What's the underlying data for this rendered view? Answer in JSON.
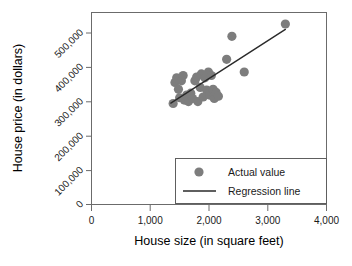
{
  "chart_data": {
    "type": "scatter",
    "title": "",
    "xlabel": "House size (in square feet)",
    "ylabel": "House price (in dollars)",
    "xlim": [
      0,
      4000
    ],
    "ylim": [
      0,
      500000
    ],
    "grid": false,
    "legend_position": "inside-bottom-right",
    "xticks": [
      0,
      1000,
      2000,
      3000,
      4000
    ],
    "xticklabels": [
      "0",
      "1,000",
      "2,000",
      "3,000",
      "4,000"
    ],
    "yticks": [
      0,
      100000,
      200000,
      300000,
      400000,
      500000
    ],
    "yticklabels": [
      "0",
      "100,000",
      "200,000",
      "300,000",
      "400,000",
      "500,000"
    ],
    "legend": [
      {
        "label": "Actual value",
        "marker": "circle",
        "color": "#7d7d7d"
      },
      {
        "label": "Regression line",
        "marker": "line",
        "color": "#2a2a2a"
      }
    ],
    "series": [
      {
        "name": "Actual value",
        "marker": "circle",
        "color": "#7d7d7d",
        "points": [
          [
            1390,
            263000
          ],
          [
            1420,
            318000
          ],
          [
            1450,
            330000
          ],
          [
            1480,
            300000
          ],
          [
            1500,
            278000
          ],
          [
            1530,
            322000
          ],
          [
            1560,
            336000
          ],
          [
            1580,
            272000
          ],
          [
            1620,
            285000
          ],
          [
            1650,
            268000
          ],
          [
            1690,
            290000
          ],
          [
            1720,
            276000
          ],
          [
            1760,
            322000
          ],
          [
            1790,
            332000
          ],
          [
            1810,
            268000
          ],
          [
            1850,
            305000
          ],
          [
            1870,
            340000
          ],
          [
            1900,
            280000
          ],
          [
            1930,
            330000
          ],
          [
            1960,
            298000
          ],
          [
            1990,
            345000
          ],
          [
            2010,
            285000
          ],
          [
            2040,
            336000
          ],
          [
            2070,
            300000
          ],
          [
            2090,
            276000
          ],
          [
            2120,
            292000
          ],
          [
            2160,
            282000
          ],
          [
            2300,
            378000
          ],
          [
            2390,
            438000
          ],
          [
            2600,
            345000
          ],
          [
            3300,
            470000
          ]
        ]
      }
    ],
    "regression_line": {
      "name": "Regression line",
      "color": "#2a2a2a",
      "x_start": 1350,
      "y_start": 264000,
      "x_end": 3300,
      "y_end": 456000
    }
  }
}
